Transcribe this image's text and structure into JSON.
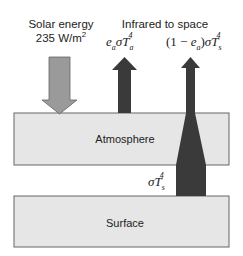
{
  "diagram": {
    "labels": {
      "solar_line1": "Solar energy",
      "solar_line2": "235 W/m",
      "solar_sup": "2",
      "infrared": "Infrared to space",
      "atm_emission": "eaσTa4",
      "surface_transmitted": "(1 − ea)σTs4",
      "surface_emission": "σTs4"
    },
    "layers": [
      {
        "name": "Atmosphere"
      },
      {
        "name": "Surface"
      }
    ],
    "colors": {
      "layer_fill": "#e6e6e6",
      "layer_stroke": "#555555",
      "solar_arrow": "#9a9a9a",
      "ir_arrow": "#3a3a3a"
    }
  }
}
